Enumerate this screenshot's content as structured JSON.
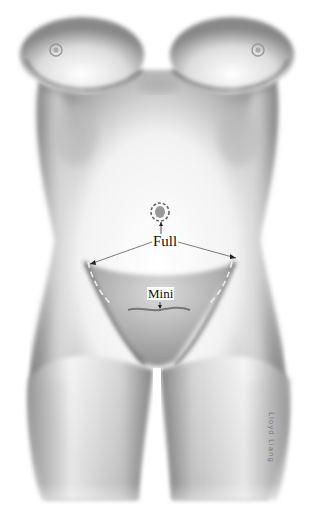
{
  "illustration": {
    "subject": "female torso anterior view",
    "labels": {
      "full": "Full",
      "mini": "Mini"
    },
    "signature": "Lloyd Liang",
    "colors": {
      "background": "#ffffff",
      "shade_dark": "#4a4a4a",
      "shade_mid": "#9a9a9a",
      "label_text": "#111111"
    }
  }
}
